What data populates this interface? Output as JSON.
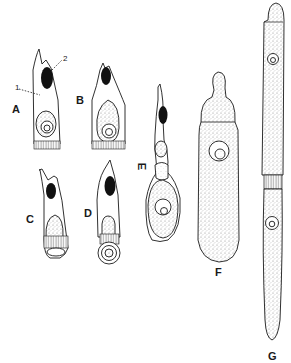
{
  "figure": {
    "panels": [
      {
        "id": "A",
        "label": "A",
        "description": "columnar cell with apical dark granule and basal nucleus"
      },
      {
        "id": "B",
        "label": "B",
        "description": "columnar cell with apical dark granule, enlarged basal nucleus"
      },
      {
        "id": "C",
        "label": "C",
        "description": "cell with dark granule, stippled nucleus, basal band"
      },
      {
        "id": "D",
        "label": "D",
        "description": "cell with dark granule, budding basal body"
      },
      {
        "id": "E",
        "label": "E",
        "description": "elongated cell with constriction and swollen base containing nucleus"
      },
      {
        "id": "F",
        "label": "F",
        "description": "bottle-shaped stippled cell with knob-like apex"
      },
      {
        "id": "G",
        "label": "G",
        "description": "very long two-segmented stippled filament with two nuclei"
      }
    ],
    "annotations": [
      {
        "id": "1",
        "label": "1",
        "target": "cell body of A"
      },
      {
        "id": "2",
        "label": "2",
        "target": "dark granule of A"
      }
    ],
    "colors": {
      "ink": "#1a1a1a",
      "stipple": "#9a9a9a",
      "granule": "#111111",
      "background": "#ffffff"
    }
  }
}
